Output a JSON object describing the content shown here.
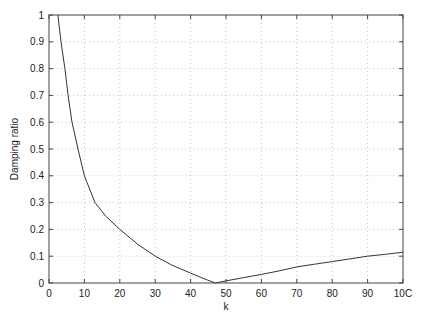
{
  "chart_data": {
    "type": "line",
    "title": "",
    "xlabel": "k",
    "ylabel": "Damping ratio",
    "xlim": [
      0,
      100
    ],
    "ylim": [
      0,
      1
    ],
    "grid": true,
    "legend": null,
    "x_ticks": [
      "0",
      "10",
      "20",
      "30",
      "40",
      "50",
      "60",
      "70",
      "80",
      "90",
      "10C"
    ],
    "y_ticks": [
      "0",
      "0.1",
      "0.2",
      "0.3",
      "0.4",
      "0.5",
      "0.6",
      "0.7",
      "0.8",
      "0.9",
      "1"
    ],
    "series": [
      {
        "name": "Damping ratio vs k",
        "x": [
          2.5,
          3.4,
          4.5,
          5.4,
          6.5,
          8.2,
          10,
          13,
          16,
          20,
          25,
          30,
          35,
          40,
          44,
          47,
          50,
          55,
          60,
          65,
          70,
          75,
          80,
          85,
          90,
          95,
          100
        ],
        "y": [
          1.0,
          0.9,
          0.8,
          0.7,
          0.6,
          0.5,
          0.4,
          0.3,
          0.25,
          0.2,
          0.145,
          0.1,
          0.065,
          0.037,
          0.015,
          0.0,
          0.008,
          0.02,
          0.032,
          0.045,
          0.06,
          0.07,
          0.08,
          0.09,
          0.1,
          0.107,
          0.115
        ]
      }
    ]
  }
}
